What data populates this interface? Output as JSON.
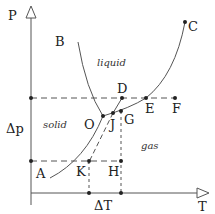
{
  "diagram": {
    "type": "phase-diagram",
    "axes": {
      "y_label": "P",
      "x_label": "T",
      "delta_p_label": "Δp",
      "delta_t_label": "ΔT"
    },
    "regions": {
      "solid": "solid",
      "liquid": "liquid",
      "gas": "gas"
    },
    "points": {
      "A": "A",
      "B": "B",
      "C": "C",
      "D": "D",
      "E": "E",
      "F": "F",
      "G": "G",
      "H": "H",
      "J": "J",
      "K": "K",
      "O": "O"
    },
    "colors": {
      "line": "#555555",
      "text": "#222222",
      "background": "#ffffff"
    }
  }
}
